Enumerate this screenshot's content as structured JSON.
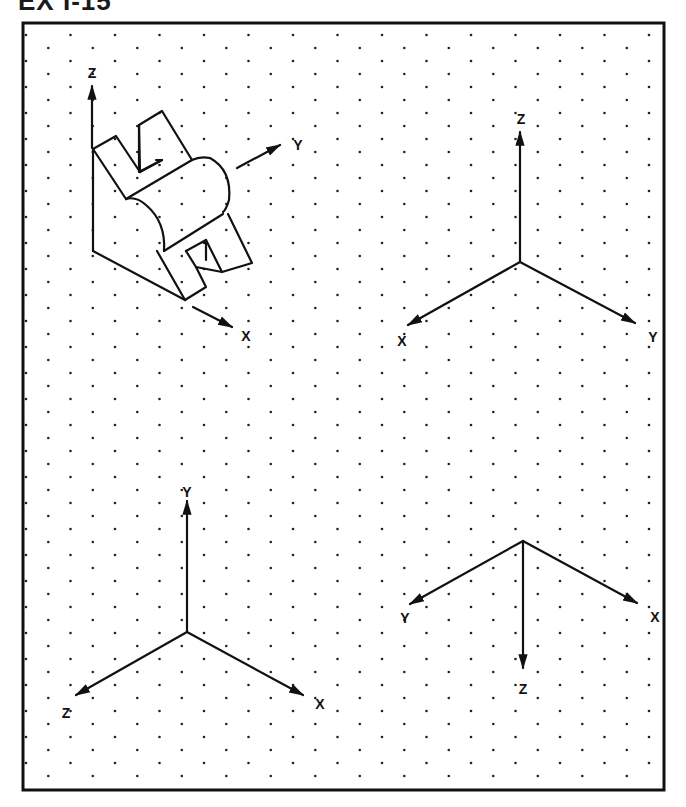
{
  "exercise": {
    "title": "EX I-15"
  },
  "colors": {
    "ink": "#111111",
    "paper": "#ffffff",
    "dot": "#222222"
  },
  "grid": {
    "type": "isometric-dot-grid",
    "frame": {
      "x": 23,
      "y": 23,
      "width": 641,
      "height": 767
    },
    "dx": 44.5,
    "dy": 13,
    "x0": 26,
    "y0": 35
  },
  "panels": [
    {
      "id": "isometric-object",
      "description": "Isometric pictorial of a bracket block with two U-slotted lugs and a half-cylinder boss",
      "axes": [
        {
          "label": "Z",
          "direction": "up"
        },
        {
          "label": "Y",
          "direction": "up-right"
        },
        {
          "label": "X",
          "direction": "down-right"
        }
      ]
    },
    {
      "id": "axes-top-right",
      "axes": [
        {
          "label": "Z",
          "direction": "up"
        },
        {
          "label": "X",
          "direction": "down-left"
        },
        {
          "label": "Y",
          "direction": "down-right"
        }
      ]
    },
    {
      "id": "axes-bottom-left",
      "axes": [
        {
          "label": "Y",
          "direction": "up"
        },
        {
          "label": "Z",
          "direction": "down-left"
        },
        {
          "label": "X",
          "direction": "down-right"
        }
      ]
    },
    {
      "id": "axes-bottom-right",
      "axes": [
        {
          "label": "Y",
          "direction": "down-left"
        },
        {
          "label": "X",
          "direction": "down-right"
        },
        {
          "label": "Z",
          "direction": "down"
        }
      ]
    }
  ]
}
